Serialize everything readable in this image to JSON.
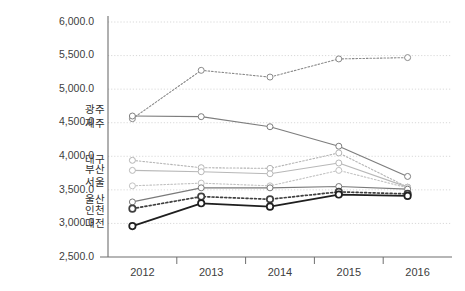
{
  "chart_data": {
    "type": "line",
    "title": "",
    "subtitle": "",
    "xlabel": "",
    "ylabel": "",
    "categories": [
      "2012",
      "2013",
      "2014",
      "2015",
      "2016"
    ],
    "x": [
      2012,
      2013,
      2014,
      2015,
      2016
    ],
    "ylim": [
      2500.0,
      6000.0
    ],
    "ytick_labels": [
      "2,500.0",
      "3,000.0",
      "3,500.0",
      "4,000.0",
      "4,500.0",
      "5,000.0",
      "5,500.0",
      "6,000.0"
    ],
    "ytick_values": [
      2500.0,
      3000.0,
      3500.0,
      4000.0,
      4500.0,
      5000.0,
      5500.0,
      6000.0
    ],
    "grid": true,
    "grid_style": "dotted-horizontal",
    "legend_position": "inline-left-labels",
    "series": [
      {
        "name": "제주",
        "values": [
          4560,
          5280,
          5180,
          5450,
          5470
        ],
        "color": "#8a8a8a",
        "style": "dotted",
        "width": 1.1,
        "marker": "open-circle",
        "label_anchor_value": 4480,
        "label_x": 105
      },
      {
        "name": "광주",
        "values": [
          4600,
          4590,
          4440,
          4150,
          3700
        ],
        "color": "#7d7d7d",
        "style": "solid",
        "width": 1.2,
        "marker": "open-circle",
        "label_anchor_value": 4690,
        "label_x": 105
      },
      {
        "name": "대구",
        "values": [
          3940,
          3830,
          3820,
          4050,
          3540
        ],
        "color": "#b4b4b4",
        "style": "dotted",
        "width": 1.1,
        "marker": "open-circle",
        "label_anchor_value": 3940,
        "label_x": 105
      },
      {
        "name": "부산",
        "values": [
          3790,
          3770,
          3740,
          3900,
          3540
        ],
        "color": "#b8b8b8",
        "style": "solid",
        "width": 1.2,
        "marker": "open-circle",
        "label_anchor_value": 3790,
        "label_x": 105
      },
      {
        "name": "서울",
        "values": [
          3560,
          3600,
          3560,
          3790,
          3530
        ],
        "color": "#c2c2c2",
        "style": "dotted",
        "width": 1.1,
        "marker": "open-circle",
        "label_anchor_value": 3600,
        "label_x": 105
      },
      {
        "name": "울산",
        "values": [
          3320,
          3530,
          3530,
          3550,
          3510
        ],
        "color": "#7a7a7a",
        "style": "solid",
        "width": 1.2,
        "marker": "open-circle",
        "label_anchor_value": 3350,
        "label_x": 105
      },
      {
        "name": "인천",
        "values": [
          3220,
          3400,
          3360,
          3470,
          3440
        ],
        "color": "#3f3f3f",
        "style": "dotted",
        "width": 1.7,
        "marker": "open-circle",
        "label_anchor_value": 3180,
        "label_x": 105
      },
      {
        "name": "대전",
        "values": [
          2960,
          3300,
          3250,
          3430,
          3410
        ],
        "color": "#1f1f1f",
        "style": "solid",
        "width": 1.8,
        "marker": "open-circle",
        "label_anchor_value": 2990,
        "label_x": 105
      }
    ]
  },
  "axes": {
    "y_axis_name": "value-axis",
    "x_axis_name": "year-axis"
  }
}
